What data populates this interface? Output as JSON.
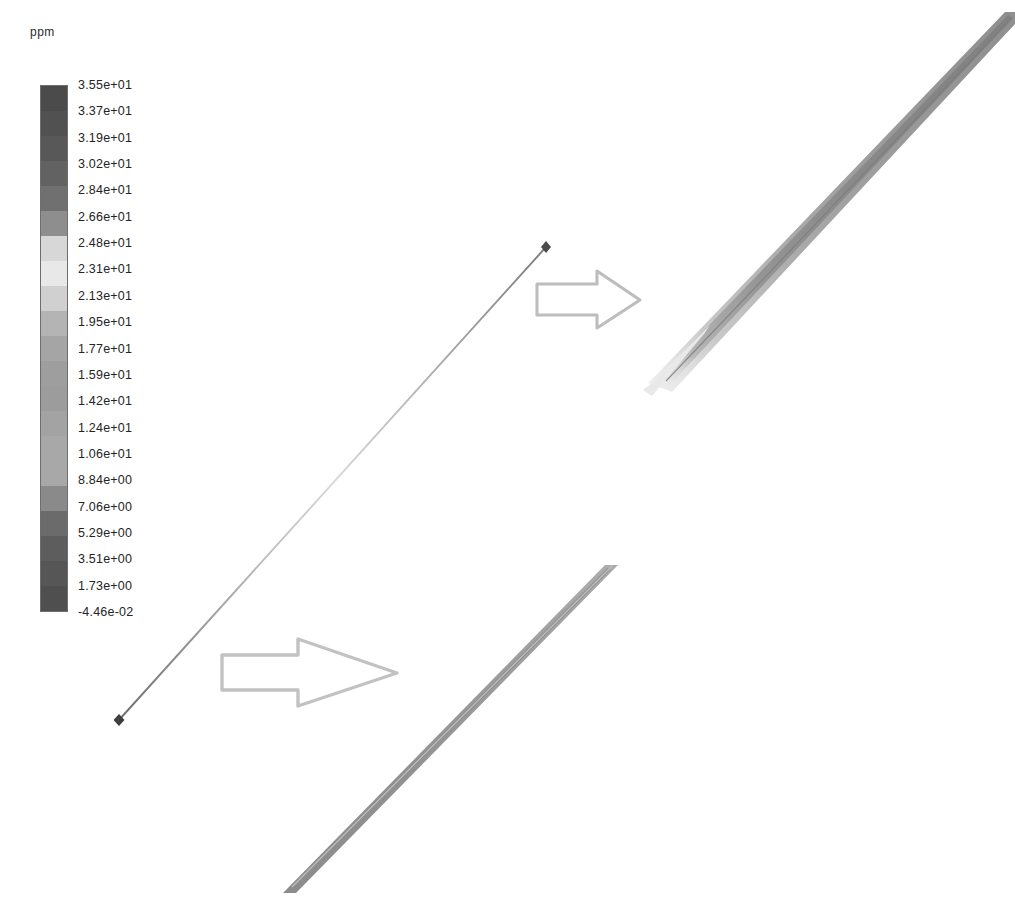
{
  "legend": {
    "title": "ppm",
    "unit": "ppm",
    "levels": [
      "3.55e+01",
      "3.37e+01",
      "3.19e+01",
      "3.02e+01",
      "2.84e+01",
      "2.66e+01",
      "2.48e+01",
      "2.31e+01",
      "2.13e+01",
      "1.95e+01",
      "1.77e+01",
      "1.59e+01",
      "1.42e+01",
      "1.24e+01",
      "1.06e+01",
      "8.84e+00",
      "7.06e+00",
      "5.29e+00",
      "3.51e+00",
      "1.73e+00",
      "-4.46e-02"
    ],
    "band_colors": [
      "#4b4b4b",
      "#515151",
      "#585858",
      "#626262",
      "#707070",
      "#8e8e8e",
      "#d7d7d7",
      "#e8e8e8",
      "#d0d0d0",
      "#b4b4b4",
      "#a5a5a5",
      "#9e9e9e",
      "#9c9c9c",
      "#a3a3a3",
      "#a8a8a8",
      "#a8a8a8",
      "#8a8a8a",
      "#6b6b6b",
      "#5d5d5d",
      "#565656",
      "#4f4f4f"
    ]
  },
  "chart_data": {
    "type": "heatmap",
    "title": "",
    "subtitle": "",
    "xlabel": "",
    "ylabel": "",
    "colorbar_label": "ppm",
    "colorbar_unit": "ppm",
    "grid": false,
    "legend_position": "left",
    "colormap": "grayscale-rainbow",
    "value_min": -0.0446,
    "value_max": 35.5,
    "contour_levels": [
      35.5,
      33.7,
      31.9,
      30.2,
      28.4,
      26.6,
      24.8,
      23.1,
      21.3,
      19.5,
      17.7,
      15.9,
      14.2,
      12.4,
      10.6,
      8.84,
      7.06,
      5.29,
      3.51,
      1.73,
      -0.0446
    ],
    "tick_labels": [
      "3.55e+01",
      "3.37e+01",
      "3.19e+01",
      "3.02e+01",
      "2.84e+01",
      "2.66e+01",
      "2.48e+01",
      "2.31e+01",
      "2.13e+01",
      "1.95e+01",
      "1.77e+01",
      "1.59e+01",
      "1.42e+01",
      "1.24e+01",
      "1.06e+01",
      "8.84e+00",
      "7.06e+00",
      "5.29e+00",
      "3.51e+00",
      "1.73e+00",
      "-4.46e-02"
    ],
    "regions": [
      {
        "name": "reference-line",
        "description": "thin diagonal reference line with endpoint markers, lower-left to upper-middle",
        "approx_value": 0.0
      },
      {
        "name": "upper-band",
        "description": "upper-right diagonal contour band, light values fading to mid-gray",
        "approx_value_range": [
          8.8,
          26.6
        ]
      },
      {
        "name": "lower-band",
        "description": "lower-right diagonal contour band, uniform mid-gray core",
        "approx_value_range": [
          17.7,
          24.8
        ]
      }
    ],
    "annotations": [
      {
        "name": "flow-arrow-upper",
        "label": "",
        "shape": "arrow",
        "direction": "right"
      },
      {
        "name": "flow-arrow-lower",
        "label": "",
        "shape": "arrow",
        "direction": "right"
      }
    ]
  }
}
